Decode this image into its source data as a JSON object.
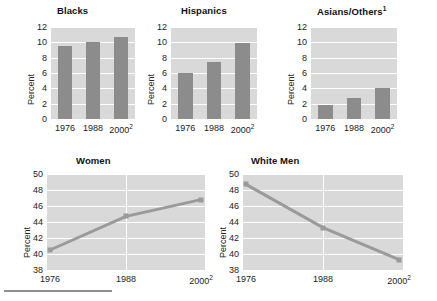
{
  "figure": {
    "ylabel": "Percent",
    "footer_rule": true
  },
  "chart_data": [
    {
      "type": "bar",
      "title": "Blacks",
      "title_sup": "",
      "categories": [
        "1976",
        "1988",
        "2000"
      ],
      "category_sups": [
        "",
        "",
        "2"
      ],
      "values": [
        9.5,
        10.0,
        10.7
      ],
      "ylabel": "Percent",
      "xlabel": "",
      "ylim": [
        0,
        12
      ],
      "yticks": [
        0,
        2,
        4,
        6,
        8,
        10,
        12
      ],
      "grid": true,
      "legend": "none",
      "bar_color": "#8c8c8c",
      "plot_bg": "#d9d9d9"
    },
    {
      "type": "bar",
      "title": "Hispanics",
      "title_sup": "",
      "categories": [
        "1976",
        "1988",
        "2000"
      ],
      "category_sups": [
        "",
        "",
        "2"
      ],
      "values": [
        6.0,
        7.5,
        9.9
      ],
      "ylabel": "Percent",
      "xlabel": "",
      "ylim": [
        0,
        12
      ],
      "yticks": [
        0,
        2,
        4,
        6,
        8,
        10,
        12
      ],
      "grid": true,
      "legend": "none",
      "bar_color": "#8c8c8c",
      "plot_bg": "#d9d9d9"
    },
    {
      "type": "bar",
      "title": "Asians/Others",
      "title_sup": "1",
      "categories": [
        "1976",
        "1988",
        "2000"
      ],
      "category_sups": [
        "",
        "",
        "2"
      ],
      "values": [
        1.8,
        2.8,
        4.0
      ],
      "ylabel": "Percent",
      "xlabel": "",
      "ylim": [
        0,
        12
      ],
      "yticks": [
        0,
        2,
        4,
        6,
        8,
        10,
        12
      ],
      "grid": true,
      "legend": "none",
      "bar_color": "#8c8c8c",
      "plot_bg": "#d9d9d9"
    },
    {
      "type": "line",
      "title": "Women",
      "title_sup": "",
      "categories": [
        "1976",
        "1988",
        "2000"
      ],
      "category_sups": [
        "",
        "",
        "2"
      ],
      "values": [
        40.5,
        44.7,
        46.8
      ],
      "ylabel": "Percent",
      "xlabel": "",
      "ylim": [
        38,
        50
      ],
      "yticks": [
        38,
        40,
        42,
        44,
        46,
        48,
        50
      ],
      "grid": true,
      "legend": "none",
      "line_color": "#9a9a9a",
      "plot_bg": "#d9d9d9"
    },
    {
      "type": "line",
      "title": "White Men",
      "title_sup": "",
      "categories": [
        "1976",
        "1988",
        "2000"
      ],
      "category_sups": [
        "",
        "",
        "2"
      ],
      "values": [
        48.7,
        43.3,
        39.3
      ],
      "ylabel": "Percent",
      "xlabel": "",
      "ylim": [
        38,
        50
      ],
      "yticks": [
        38,
        40,
        42,
        44,
        46,
        48,
        50
      ],
      "grid": true,
      "legend": "none",
      "line_color": "#9a9a9a",
      "plot_bg": "#d9d9d9"
    }
  ]
}
